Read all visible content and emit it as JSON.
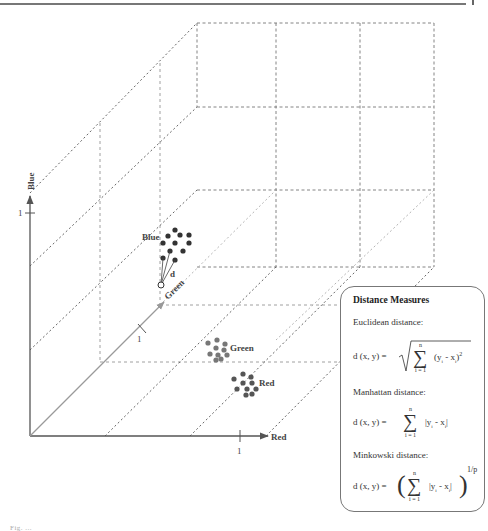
{
  "axes": {
    "red": {
      "label": "Red",
      "tick": "1"
    },
    "green": {
      "label": "Green",
      "tick": "1"
    },
    "blue": {
      "label": "Blue",
      "tick": "1"
    }
  },
  "clusters": [
    {
      "label": "Blue",
      "color": "#333333",
      "points": 11
    },
    {
      "label": "Green",
      "color": "#777777",
      "points": 10
    },
    {
      "label": "Red",
      "color": "#555555",
      "points": 10
    }
  ],
  "distance_label": "d",
  "colors": {
    "axis": "#555555",
    "green_axis": "#9a9a9a",
    "dash": "#777777",
    "box_border": "#777777"
  },
  "measures": {
    "title": "Distance Measures",
    "euclidean": {
      "name": "Euclidean distance:",
      "lhs": "d (x, y) =",
      "upper": "n",
      "lower": "i = 1",
      "term": "(y",
      "sub_i": "i",
      "minus": " - x",
      "sub_i2": "i",
      "close": ")",
      "power": "2"
    },
    "manhattan": {
      "name": "Manhattan distance:",
      "lhs": "d (x, y) =",
      "upper": "n",
      "lower": "i = 1",
      "term": "|y",
      "sub_i": "i",
      "minus": " - x",
      "sub_i2": "i",
      "close": "|"
    },
    "minkowski": {
      "name": "Minkowski distance:",
      "lhs": "d (x, y) =",
      "upper": "n",
      "lower": "i = 1",
      "term": "|y",
      "sub_i": "i",
      "minus": " - x",
      "sub_i2": "i",
      "close": "|",
      "power": "1/p"
    }
  },
  "caption": "Fig. ..."
}
